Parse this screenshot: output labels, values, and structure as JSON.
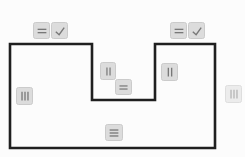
{
  "canvas": {
    "width": 245,
    "height": 157,
    "background": "#fcfcfc"
  },
  "polygon": {
    "points": "10,44 92,44 92,100 155,100 155,44 215,44 215,148 10,148",
    "stroke": "#1f1f1f",
    "stroke_width": 2.6,
    "fill": "none"
  },
  "colors": {
    "marker_bg": "#dcdcdc",
    "marker_border": "#cbcbcb",
    "icon_stroke": "#787878",
    "marker_bg_faded": "#ececec",
    "marker_border_faded": "#dedede",
    "icon_stroke_faded": "#b5b5b5"
  },
  "markers": [
    {
      "name": "side-marker-top-left-double-tick",
      "icon": "double-horizontal-tick-icon",
      "x": 33,
      "y": 22,
      "w": 17,
      "h": 17,
      "faded": false
    },
    {
      "name": "check-marker-top-left",
      "icon": "checkmark-icon",
      "x": 51,
      "y": 22,
      "w": 17,
      "h": 17,
      "faded": false
    },
    {
      "name": "side-marker-top-right-double-tick",
      "icon": "double-horizontal-tick-icon",
      "x": 170,
      "y": 22,
      "w": 17,
      "h": 17,
      "faded": false
    },
    {
      "name": "check-marker-top-right",
      "icon": "checkmark-icon",
      "x": 188,
      "y": 22,
      "w": 17,
      "h": 17,
      "faded": false
    },
    {
      "name": "side-marker-notch-left-double-tick",
      "icon": "double-vertical-tick-icon",
      "x": 100,
      "y": 62,
      "w": 16,
      "h": 18,
      "faded": false
    },
    {
      "name": "side-marker-notch-bottom-double-tick",
      "icon": "double-horizontal-tick-icon",
      "x": 115,
      "y": 79,
      "w": 17,
      "h": 16,
      "faded": false
    },
    {
      "name": "side-marker-notch-right-double-tick",
      "icon": "double-vertical-tick-icon",
      "x": 161,
      "y": 63,
      "w": 17,
      "h": 18,
      "faded": false
    },
    {
      "name": "side-marker-left-triple-tick",
      "icon": "triple-vertical-tick-icon",
      "x": 16,
      "y": 87,
      "w": 17,
      "h": 18,
      "faded": false
    },
    {
      "name": "side-marker-right-triple-tick",
      "icon": "triple-vertical-tick-icon",
      "x": 225,
      "y": 85,
      "w": 17,
      "h": 18,
      "faded": true
    },
    {
      "name": "side-marker-bottom-triple-tick",
      "icon": "triple-horizontal-tick-icon",
      "x": 105,
      "y": 124,
      "w": 18,
      "h": 17,
      "faded": false
    }
  ]
}
